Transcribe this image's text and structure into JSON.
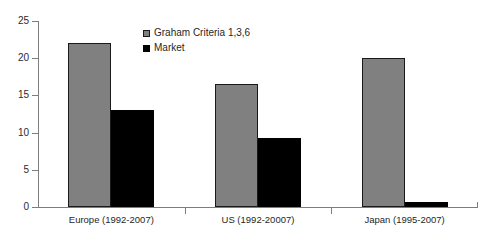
{
  "chart_data": {
    "type": "bar",
    "title": "",
    "subtitle": "",
    "xlabel": "",
    "ylabel": "",
    "ylim": [
      0,
      25
    ],
    "ytick_labels": [
      "0",
      "5",
      "10",
      "15",
      "20",
      "25"
    ],
    "ytick_values": [
      0,
      5,
      10,
      15,
      20,
      25
    ],
    "grid": false,
    "legend_position": "inside-top-center",
    "categories": [
      "Europe (1992-2007)",
      "US (1992-20007)",
      "Japan (1995-2007)"
    ],
    "series": [
      {
        "name": "Graham Criteria 1,3,6",
        "color": "#808080",
        "values": [
          22,
          16.5,
          20
        ]
      },
      {
        "name": "Market",
        "color": "#000000",
        "values": [
          13,
          9.3,
          0.7
        ]
      }
    ]
  },
  "legend": {
    "items": [
      {
        "label": "Graham Criteria 1,3,6",
        "swatch": "gray-square-icon"
      },
      {
        "label": "Market",
        "swatch": "black-square-icon"
      }
    ]
  },
  "axes": {
    "y_ticks": [
      "0",
      "5",
      "10",
      "15",
      "20",
      "25"
    ],
    "x_categories": [
      "Europe (1992-2007)",
      "US (1992-20007)",
      "Japan (1995-2007)"
    ]
  }
}
